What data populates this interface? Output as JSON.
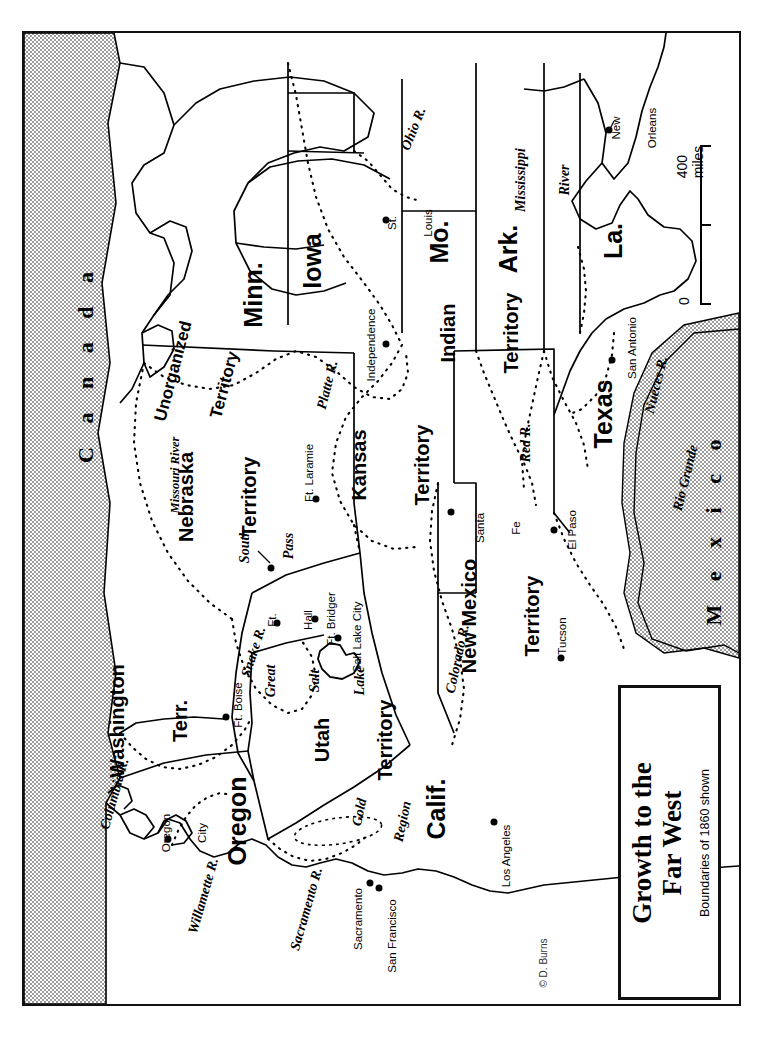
{
  "map": {
    "title_line1": "Growth to the",
    "title_line2": "Far West",
    "subtitle": "Boundaries of 1860 shown",
    "credit": "© D. Burns",
    "scale": {
      "max_label": "400 miles",
      "min_label": "0",
      "unit": "miles",
      "max_value": 400,
      "min_value": 0
    },
    "colors": {
      "land": "#ffffff",
      "foreign": "#d7d7d7",
      "ink": "#000000",
      "frame": "#111111"
    }
  },
  "countries": [
    {
      "name": "Canada",
      "label": "C a n a d a"
    },
    {
      "name": "Mexico",
      "label": "M e x i c o"
    }
  ],
  "states": [
    {
      "label": "Minn.",
      "kind": "state"
    },
    {
      "label": "Iowa",
      "kind": "state"
    },
    {
      "label": "Mo.",
      "kind": "state"
    },
    {
      "label": "Ark.",
      "kind": "state"
    },
    {
      "label": "La.",
      "kind": "state"
    },
    {
      "label": "Texas",
      "kind": "state"
    },
    {
      "label": "Calif.",
      "kind": "state"
    },
    {
      "label": "Oregon",
      "kind": "state"
    }
  ],
  "territories": [
    {
      "line1": "Unorganized",
      "line2": "Territory"
    },
    {
      "line1": "Nebraska",
      "line2": "Territory"
    },
    {
      "line1": "Kansas",
      "line2": "Territory"
    },
    {
      "line1": "Indian",
      "line2": "Territory"
    },
    {
      "line1": "New Mexico",
      "line2": "Territory"
    },
    {
      "line1": "Utah",
      "line2": "Territory"
    },
    {
      "line1": "Washington",
      "line2": "Terr."
    }
  ],
  "cities": [
    {
      "label": "St.\nLouis"
    },
    {
      "label": "Independence"
    },
    {
      "label": "New\nOrleans"
    },
    {
      "label": "San Antonio"
    },
    {
      "label": "Santa\nFe"
    },
    {
      "label": "El Paso"
    },
    {
      "label": "Tucson"
    },
    {
      "label": "Los Angeles"
    },
    {
      "label": "San Francisco"
    },
    {
      "label": "Sacramento"
    },
    {
      "label": "Salt Lake City"
    },
    {
      "label": "Ft. Bridger"
    },
    {
      "label": "Ft.\nHall"
    },
    {
      "label": "Ft. Boise"
    },
    {
      "label": "Ft. Laramie"
    },
    {
      "label": "Oregon\nCity"
    }
  ],
  "rivers": [
    {
      "label": "Ohio R."
    },
    {
      "label": "Mississippi\nRiver"
    },
    {
      "label": "Missouri River"
    },
    {
      "label": "Platte R."
    },
    {
      "label": "Red R."
    },
    {
      "label": "Rio Grande"
    },
    {
      "label": "Nueces R."
    },
    {
      "label": "Colorado R."
    },
    {
      "label": "Snake R."
    },
    {
      "label": "Columbia R."
    },
    {
      "label": "Willamette R."
    },
    {
      "label": "Sacramento R."
    }
  ],
  "features": [
    {
      "label": "Great\nSalt\nLake",
      "type": "lake"
    },
    {
      "label": "South\nPass",
      "type": "pass"
    },
    {
      "label": "Gold\nRegion",
      "type": "region"
    }
  ],
  "labels": {
    "canada": "C a n a d a",
    "mexico": "M e x i c o",
    "minn": "Minn.",
    "iowa": "Iowa",
    "mo": "Mo.",
    "ark": "Ark.",
    "la": "La.",
    "texas": "Texas",
    "calif": "Calif.",
    "oregon": "Oregon",
    "unorganized_1": "Unorganized",
    "unorganized_2": "Territory",
    "nebraska_1": "Nebraska",
    "nebraska_2": "Territory",
    "kansas_1": "Kansas",
    "kansas_2": "Territory",
    "indian_1": "Indian",
    "indian_2": "Territory",
    "newmexico_1": "New Mexico",
    "newmexico_2": "Territory",
    "utah_1": "Utah",
    "utah_2": "Territory",
    "washington_1": "Washington",
    "washington_2": "Terr.",
    "st_louis_1": "St.",
    "st_louis_2": "Louis",
    "independence": "Independence",
    "new_orleans_1": "New",
    "new_orleans_2": "Orleans",
    "san_antonio": "San Antonio",
    "santa_fe_1": "Santa",
    "santa_fe_2": "Fe",
    "el_paso": "El Paso",
    "tucson": "Tucson",
    "los_angeles": "Los Angeles",
    "san_francisco": "San Francisco",
    "sacramento": "Sacramento",
    "salt_lake_city": "Salt Lake City",
    "ft_bridger": "Ft. Bridger",
    "ft_hall_1": "Ft.",
    "ft_hall_2": "Hall",
    "ft_boise": "Ft. Boise",
    "ft_laramie": "Ft. Laramie",
    "oregon_city_1": "Oregon",
    "oregon_city_2": "City",
    "ohio_r": "Ohio R.",
    "mississippi_1": "Mississippi",
    "mississippi_2": "River",
    "missouri_river": "Missouri River",
    "platte_r": "Platte R.",
    "red_r": "Red R.",
    "rio_grande": "Rio Grande",
    "nueces_r": "Nueces R.",
    "colorado_r": "Colorado R.",
    "snake_r": "Snake R.",
    "columbia_r": "Columbia R.",
    "willamette_r": "Willamette R.",
    "sacramento_r": "Sacramento R.",
    "great_salt_lake_1": "Great",
    "great_salt_lake_2": "Salt",
    "great_salt_lake_3": "Lake",
    "south_pass_1": "South",
    "south_pass_2": "Pass",
    "gold_region_1": "Gold",
    "gold_region_2": "Region"
  }
}
